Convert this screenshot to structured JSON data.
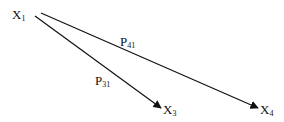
{
  "nodes": [
    {
      "id": "X1",
      "base": "X",
      "sub": "1"
    },
    {
      "id": "X3",
      "base": "X",
      "sub": "3"
    },
    {
      "id": "X4",
      "base": "X",
      "sub": "4"
    }
  ],
  "edges": [
    {
      "from": "X1",
      "to": "X3",
      "label_base": "P",
      "label_sub": "31"
    },
    {
      "from": "X1",
      "to": "X4",
      "label_base": "P",
      "label_sub": "41"
    }
  ],
  "colors": {
    "line": "#111111",
    "background": "#ffffff"
  }
}
